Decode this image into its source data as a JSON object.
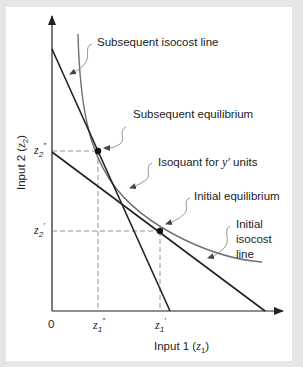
{
  "diagram": {
    "type": "isoquant-isocost",
    "axes": {
      "x_label": "Input 1",
      "x_var": "z",
      "x_var_sub": "1",
      "y_label": "Input 2",
      "y_var": "z",
      "y_var_sub": "2",
      "origin": "0"
    },
    "ticks": {
      "x": [
        {
          "var": "z",
          "sub": "1",
          "prime": "″",
          "name": "z1-double-prime"
        },
        {
          "var": "z",
          "sub": "1",
          "prime": "′",
          "name": "z1-prime"
        }
      ],
      "y": [
        {
          "var": "z",
          "sub": "2",
          "prime": "″",
          "name": "z2-double-prime"
        },
        {
          "var": "z",
          "sub": "2",
          "prime": "′",
          "name": "z2-prime"
        }
      ]
    },
    "annotations": {
      "subsequent_isocost": "Subsequent isocost line",
      "subsequent_equilibrium": "Subsequent equilibrium",
      "isoquant_prefix": "Isoquant for ",
      "isoquant_var": "y′",
      "isoquant_suffix": " units",
      "initial_equilibrium": "Initial equilibrium",
      "initial_isocost_1": "Initial",
      "initial_isocost_2": "isocost",
      "initial_isocost_3": "line"
    },
    "colors": {
      "line": "#222222",
      "curve": "#6f6f6f",
      "dashed": "#777777",
      "leader": "#8a8a8a",
      "background": "#e6e6e6",
      "panel": "#ffffff"
    }
  }
}
